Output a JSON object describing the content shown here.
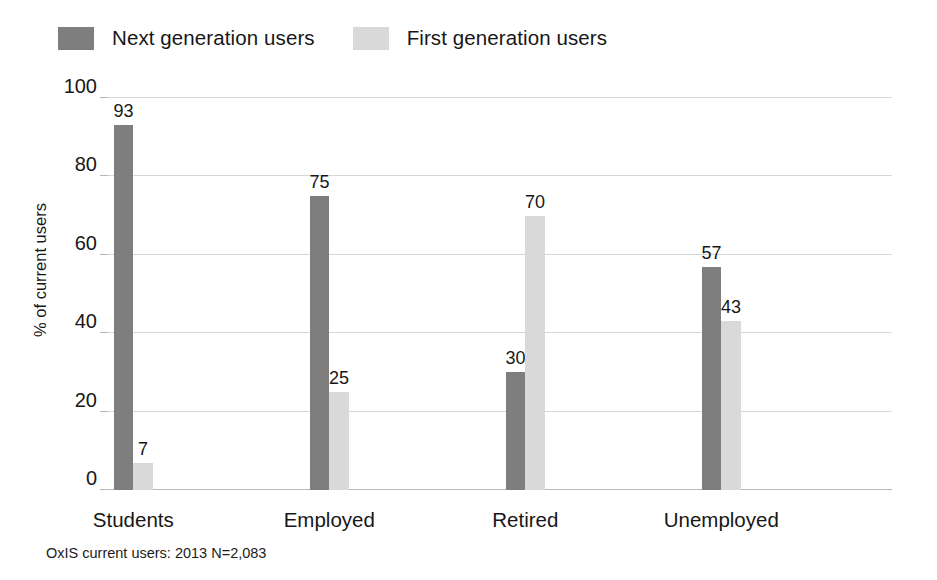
{
  "chart_data": {
    "type": "bar",
    "title": "",
    "subtitle": "",
    "xlabel": "",
    "ylabel": "% of current users",
    "categories": [
      "Students",
      "Employed",
      "Retired",
      "Unemployed"
    ],
    "series": [
      {
        "name": "Next generation users",
        "color": "#7e7e7e",
        "values": [
          93,
          75,
          30,
          57
        ]
      },
      {
        "name": "First generation users",
        "color": "#d9d9d9",
        "values": [
          7,
          25,
          70,
          43
        ]
      }
    ],
    "ylim": [
      0,
      100
    ],
    "yticks": [
      0,
      20,
      40,
      60,
      80,
      100
    ],
    "ytick_labels": [
      "0",
      "20",
      "40",
      "60",
      "80",
      "100"
    ],
    "grid": "horizontal",
    "legend_position": "top-left",
    "bar_labels_shown": true,
    "annotation": "OxIS current users: 2013 N=2,083"
  },
  "legend": {
    "entries": [
      {
        "label": "Next generation users",
        "swatch": "#7e7e7e"
      },
      {
        "label": "First generation users",
        "swatch": "#d9d9d9"
      }
    ]
  },
  "footnote": "OxIS current users: 2013 N=2,083"
}
